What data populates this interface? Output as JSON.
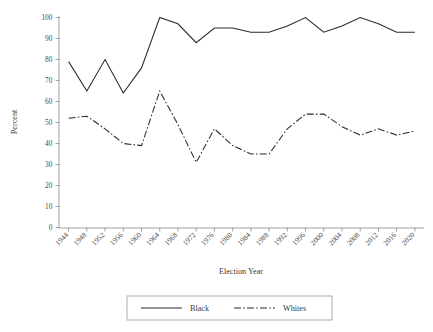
{
  "chart_data": {
    "type": "line",
    "title": "",
    "xlabel": "Election Year",
    "ylabel": "Percent",
    "ylim": [
      0,
      100
    ],
    "yticks": [
      0,
      10,
      20,
      30,
      40,
      50,
      60,
      70,
      80,
      90,
      100
    ],
    "grid": false,
    "legend_position": "bottom",
    "categories": [
      "1944",
      "1948",
      "1952",
      "1956",
      "1960",
      "1964",
      "1968",
      "1972",
      "1976",
      "1980",
      "1984",
      "1988",
      "1992",
      "1996",
      "2000",
      "2004",
      "2008",
      "2012",
      "2016",
      "2020"
    ],
    "series": [
      {
        "name": "Black",
        "style": "solid",
        "color": "#2b2b2b",
        "values": [
          79,
          65,
          80,
          64,
          76,
          100,
          97,
          88,
          95,
          95,
          93,
          93,
          96,
          100,
          93,
          96,
          100,
          97,
          93,
          93
        ]
      },
      {
        "name": "Whites",
        "style": "dash-dot",
        "color": "#2b2b2b",
        "values": [
          52,
          53,
          47,
          40,
          39,
          65,
          49,
          31,
          47,
          39,
          35,
          35,
          47,
          54,
          54,
          48,
          44,
          47,
          44,
          46
        ]
      }
    ]
  },
  "axes": {
    "x_title": "Election Year",
    "y_title": "Percent"
  },
  "legend": {
    "items": [
      {
        "label": "Black",
        "style": "solid"
      },
      {
        "label": "Whites",
        "style": "dash-dot"
      }
    ]
  }
}
